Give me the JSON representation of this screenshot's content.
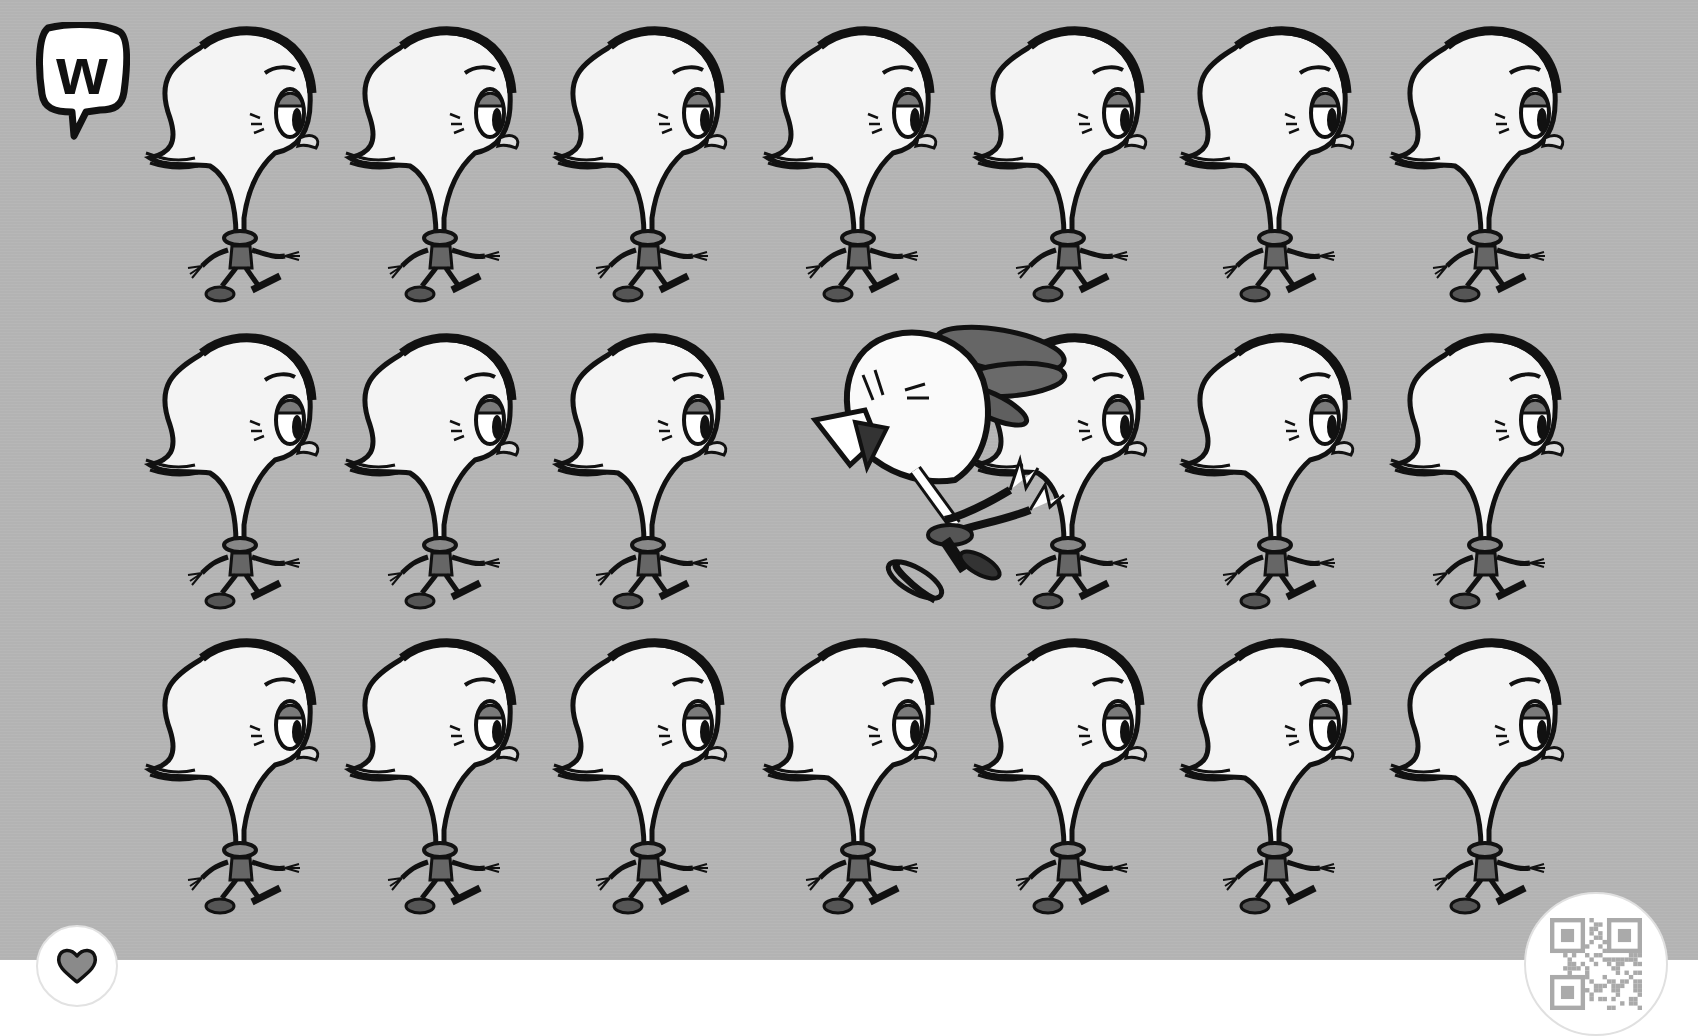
{
  "scene": {
    "title": "Find the odd one out",
    "grid": {
      "rows": 3,
      "columns": 7
    },
    "odd_one_out": {
      "row": 2,
      "column": 4,
      "description": "jumping white chick with dark tail feathers"
    },
    "bird_description": "walking long-neck bird with sleepy eye"
  },
  "colors": {
    "background": "#b3b3b3",
    "footer": "#ffffff",
    "outline": "#111111",
    "bird_fill": "#f4f4f4",
    "accent_gray": "#6e6e6e"
  },
  "logo": {
    "letter": "w",
    "icon": "speech-bubble-w-logo"
  },
  "controls": {
    "like": {
      "icon": "heart-icon",
      "label": "Like"
    },
    "qr": {
      "icon": "qr-code-icon",
      "label": "QR code"
    }
  }
}
